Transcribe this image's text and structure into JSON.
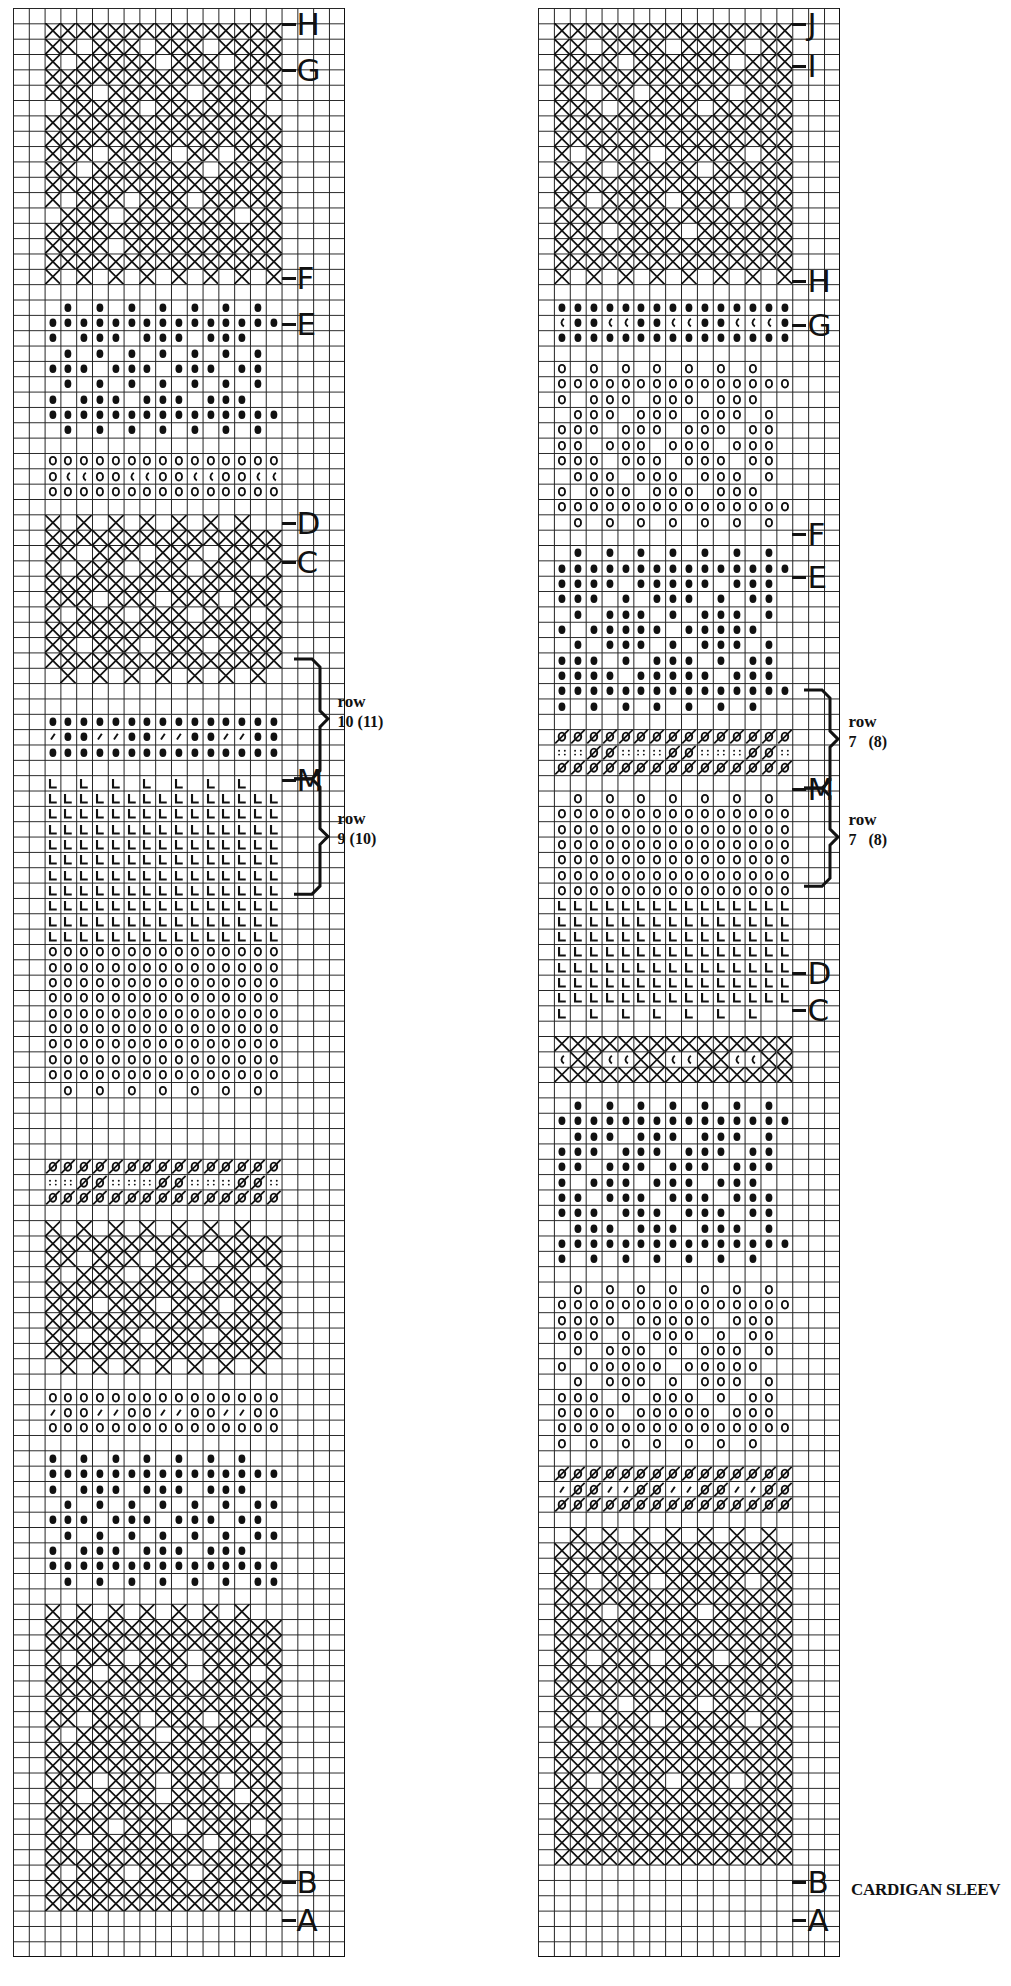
{
  "caption": "CARDIGAN SLEEV",
  "symbols": {
    "X": "cross",
    "D": "dot-filled",
    "O": "circle-open",
    "L": "corner-L",
    "S": "slash",
    "Z": "slashed-circle",
    "C": "c-mark",
    "P": "four-dots"
  },
  "charts": [
    {
      "id": "left",
      "x": 13,
      "y": 8,
      "cols": 21,
      "rows": 127,
      "cell_w": 15.8,
      "cell_h": 15.35,
      "pattern_col_start": 2,
      "pattern_cols": 15,
      "markers": [
        {
          "label": "H",
          "row": 1
        },
        {
          "label": "G",
          "row": 4
        },
        {
          "label": "F",
          "row": 17.5
        },
        {
          "label": "E",
          "row": 20.5
        },
        {
          "label": "D",
          "row": 33.5
        },
        {
          "label": "C",
          "row": 36
        },
        {
          "label": "M",
          "row": 50.2
        },
        {
          "label": "B",
          "row": 122
        },
        {
          "label": "A",
          "row": 124.5
        }
      ],
      "braces": [
        {
          "row_top": 42.4,
          "row_bottom": 50.2,
          "label_word": "row",
          "label_num": "10 (11)"
        },
        {
          "row_top": 50.2,
          "row_bottom": 57.7,
          "label_word": "row",
          "label_num": "9 (10)"
        }
      ],
      "sections": [
        {
          "start": 1,
          "rows": [
            "XXXXXXXXXXXXXXX",
            "XX.XXX.XXX.XXXX",
            "X.XXXXX.XXX.XXX",
            "XXXXXXXXXXXXXXX",
            "XXX.XXXXX.XXX.X",
            ".XXXXX.XXXXXXX.",
            "XXXXXXXXXXXXXXX",
            "XXXXXXXXXXXXXXX",
            "XXX.XXXX.XX.XXX",
            "XX.XXXXXXX.XXXX",
            "XXXXXXXXXXXXXXX",
            "X.XXX.XXX.XXXXX",
            ".XXX.XXXXXXX.XX",
            "XXXXXXXXXXXXXXX",
            "XXXX.XXXXXXXXXX",
            "XXXXXXXXXXXXXXX",
            "X.X.X.X.X.X.X.X"
          ]
        },
        {
          "start": 19,
          "rows": [
            ".D.D.D.D.D.D.D.",
            "DDDDDDDDDDDDDDD",
            "D.DDD.DDD.DDD..",
            ".D.D.D.D.D.D.D.",
            "DDD.DDD.DDD.DD.",
            ".D.D.D.D.D.D.D.",
            "D.DDD.DDD.DDD..",
            "DDDDDDDDDDDDDDD",
            ".D.D.D.D.D.D.D."
          ]
        },
        {
          "start": 29,
          "rows": [
            "OOOOOOOOOOOOOOO",
            "OCCOOCCOOCCOOCC",
            "OOOOOOOOOOOOOOO"
          ]
        },
        {
          "start": 33,
          "rows": [
            "X.X.X.X.X.X.X..",
            "XXXXXXXXXXXXXXX",
            "XX.XXX.XXX.XXXX",
            "X.XXX.XXX.XXX.X",
            "XXXXXXXXXXXXXXX",
            "XXX.XXX.XXX.XXX",
            "X.XXX.XXX.XXX.X",
            "XXXXXXXXXXXXXXX",
            "XX.XXX.XXX.XXXX",
            "XXXXXXXXXXXXXXX",
            ".X.X.X.X.X.X.X."
          ]
        },
        {
          "start": 46,
          "rows": [
            "DDDDDDDDDDDDDDD",
            "SDDSSDDSSDDSSDD",
            "DDDDDDDDDDDDDDD"
          ]
        },
        {
          "start": 50,
          "rows": [
            "L.L.L.L.L.L.L..",
            "LLLLLLLLLLLLLLL",
            "LLLLLLLLLLLLLLL",
            "LLLLLLLLLLLLLLL",
            "LLLLLLLLLLLLLLL",
            "LLLLLLLLLLLLLLL",
            "LLLLLLLLLLLLLLL",
            "LLLLLLLLLLLLLLL",
            "LLLLLLLLLLLLLLL",
            "LLLLLLLLLLLLLLL",
            "LLLLLLLLLLLLLLL",
            "OOOOOOOOOOOOOOO",
            "OOOOOOOOOOOOOOO",
            "OOOOOOOOOOOOOOO",
            "OOOOOOOOOOOOOOO",
            "OOOOOOOOOOOOOOO",
            "OOOOOOOOOOOOOOO",
            "OOOOOOOOOOOOOOO",
            "OOOOOOOOOOOOOOO",
            "OOOOOOOOOOOOOOO",
            ".O.O.O.O.O.O.O."
          ]
        },
        {
          "start": 75,
          "rows": [
            "ZZZZZZZZZZZZZZZ",
            "PPZZPPPZZPPPZZP",
            "ZZZZZZZZZZZZZZZ"
          ]
        },
        {
          "start": 79,
          "rows": [
            "X.X.X.X.X.X.X..",
            "XXXXXXXXXXXXXXX",
            "XX.XXX.XXX.XXXX",
            "X.XXX.XXX.XXX.X",
            "XXXXXXXXXXXXXXX",
            "XXX.XXX.XXX.XXX",
            "XXXXXXXXXXXXXXX",
            "XX.XXX.XXX.XXXX",
            "XXXXXXXXXXXXXXX",
            ".X.X.X.X.X.X.X."
          ]
        },
        {
          "start": 90,
          "rows": [
            "OOOOOOOOOOOOOOO",
            "SOOSSOOSSOOSSOO",
            "OOOOOOOOOOOOOOO"
          ]
        },
        {
          "start": 94,
          "rows": [
            "D.D.D.D.D.D.D..",
            "DDDDDDDDDDDDDDD",
            "D.DDD.DDD.DDD..",
            ".D.D.D.D.D.D.DD",
            "DDD.DDD.DDD.DD.",
            ".D.D.D.D.D.D.DD",
            "D.DDD.DDD.DDD..",
            "DDDDDDDDDDDDDDD",
            ".D.D.D.D.D.D.DD"
          ]
        },
        {
          "start": 104,
          "rows": [
            "X.X.X.X.X.X.X..",
            "XXXXXXXXXXXXXXX",
            "XXXXXXXXXXXXXXX",
            "X.XXX.XXX.XXXXX",
            "XXX.XXXXX.XXX.X",
            "XXXXXXXXXXXXXXX",
            "XXXXXXXXXXXXXXX",
            "XX.XXX.XXX.XXXX",
            "X.XXXXX.XXXXX.X",
            "XXXXXXXXXXXXXXX",
            "XXXXXXXXXXXXXXX",
            "XXX.XXX.XXX.XXX",
            "XX.XXXX.XXXX.XX",
            "XXXXXXXXXXXXXXX",
            "XXXX.XXX.XXXX.X",
            "XX.XXXXXXX.XXXX",
            "XXXXXXXXXXXXXXX",
            "X.XXX.XXX.XXXXX",
            "XXXXXXXXXXXXXXX",
            "XXXXXXXXXXXXXXX"
          ]
        }
      ]
    },
    {
      "id": "right",
      "x": 538,
      "y": 8,
      "cols": 19,
      "rows": 127,
      "cell_w": 15.9,
      "cell_h": 15.35,
      "pattern_col_start": 1,
      "pattern_cols": 15,
      "markers": [
        {
          "label": "J",
          "row": 1
        },
        {
          "label": "I",
          "row": 3.7
        },
        {
          "label": "H",
          "row": 17.7
        },
        {
          "label": "G",
          "row": 20.6
        },
        {
          "label": "F",
          "row": 34.2
        },
        {
          "label": "E",
          "row": 37
        },
        {
          "label": "M",
          "row": 50.8
        },
        {
          "label": "D",
          "row": 62.8
        },
        {
          "label": "C",
          "row": 65.2
        },
        {
          "label": "B",
          "row": 122
        },
        {
          "label": "A",
          "row": 124.5
        }
      ],
      "braces": [
        {
          "row_top": 44.4,
          "row_bottom": 50.8,
          "label_word": "row",
          "label_num": "7   (8)"
        },
        {
          "row_top": 50.8,
          "row_bottom": 57.2,
          "label_word": "row",
          "label_num": "7   (8)"
        }
      ],
      "sections": [
        {
          "start": 1,
          "rows": [
            "XXXXXXXXXXXXXXX",
            "XX.XXXX.XXXX.XX",
            "XXXX.XXXXXX.XXX",
            "XXXXXXXXXXXXXXX",
            "XX.XX.XXXXX.XXX",
            "XXX.XXXXX.XXXXX",
            "XXXXXXXXXXXXXXX",
            "XXXXXXXXXXXXXXX",
            "X.XXXX.XXXXX.XX",
            "XXX.XXXXX.XXXXX",
            "XXXXXXXXXXXXXXX",
            "XX.XXXX.XXX.XXX",
            "XXXXXXXXXXXXXXX",
            "XXX.XXXX.XXXXXX",
            "XXXXXXXXXXXXXXX",
            "XXXXXXXXXXXXXXX",
            "X.X.X.X.X.X.X.X"
          ]
        },
        {
          "start": 19,
          "rows": [
            "DDDDDDDDDDDDDDD",
            "CDDCCDDCCDDCCCD",
            "DDDDDDDDDDDDDDD"
          ]
        },
        {
          "start": 23,
          "rows": [
            "O.O.O.O.O.O.O..",
            "OOOOOOOOOOOOOOO",
            "O.OOO.OOO.OOO..",
            ".OOO.OOO.OOO.O.",
            "OOO.OOO.OOO.OO.",
            "OO.OOO.OOO.OOO.",
            "OOO.OOO.OOO.OO.",
            ".OOO.OOO.OOO.O.",
            "O.OOO.OOO.OOO..",
            "OOOOOOOOOOOOOOO",
            ".O.O.O.O.O.O.O."
          ]
        },
        {
          "start": 35,
          "rows": [
            ".D.D.D.D.D.D.D.",
            "DDDDDDDDDDDDDDD",
            "DDDD.DDDDD.DDD.",
            "DDD.D.DDD.D.DD.",
            ".D.DDD.D.DDD.D.",
            "D.DDDDD.DDDDD..",
            ".D.DDD.D.DDD.D.",
            "DDD.D.DDD.D.DD.",
            "DDDD.DDDDD.DDD.",
            "DDDDDDDDDDDDDDD",
            "D.D.D.D.D.D.D.."
          ]
        },
        {
          "start": 47,
          "rows": [
            "ZZZZZZZZZZZZZZZ",
            "PPZZPPPZZPPPZZP",
            "ZZZZZZZZZZZZZZZ"
          ]
        },
        {
          "start": 51,
          "rows": [
            ".O.O.O.O.O.O.O.",
            "OOOOOOOOOOOOOOO",
            "OOOOOOOOOOOOOOO",
            "OOOOOOOOOOOOOOO",
            "OOOOOOOOOOOOOOO",
            "OOOOOOOOOOOOOOO",
            "OOOOOOOOOOOOOOO",
            "LLLLLLLLLLLLLLL",
            "LLLLLLLLLLLLLLL",
            "LLLLLLLLLLLLLLL",
            "LLLLLLLLLLLLLLL",
            "LLLLLLLLLLLLLLL",
            "LLLLLLLLLLLLLLL",
            "LLLLLLLLLLLLLLL",
            "L.L.L.L.L.L.L.."
          ]
        },
        {
          "start": 67,
          "rows": [
            "XXXXXXXXXXXXXXX",
            "CXXCCXXCCXXCCXX",
            "XXXXXXXXXXXXXXX"
          ]
        },
        {
          "start": 71,
          "rows": [
            ".D.D.D.D.D.D.D.",
            "DDDDDDDDDDDDDDD",
            ".DDD.DDD.DDD.D.",
            "DDD.DDD.DDD.DD.",
            "DD.DDD.DDD.DDD.",
            "D.DDD.DDD.DDD..",
            "DD.DDD.DDD.DDD.",
            "DDD.DDD.DDD.DD.",
            ".DDD.DDD.DDD.D.",
            "DDDDDDDDDDDDDDD",
            "D.D.D.D.D.D.D.."
          ]
        },
        {
          "start": 83,
          "rows": [
            ".O.O.O.O.O.O.O.",
            "OOOOOOOOOOOOOOO",
            "OOOO.OOOOO.OOO.",
            "OOO.O.OOO.O.OO.",
            ".O.OOO.O.OOO.O.",
            "O.OOOOO.OOOOO..",
            ".O.OOO.O.OOO.O.",
            "OOO.O.OOO.O.OO.",
            "OOOO.OOOOO.OOO.",
            "OOOOOOOOOOOOOOO",
            "O.O.O.O.O.O.O.."
          ]
        },
        {
          "start": 95,
          "rows": [
            "ZZZZZZZZZZZZZZZ",
            "SZZSSZZSSZZSSZZ",
            "ZZZZZZZZZZZZZZZ"
          ]
        },
        {
          "start": 99,
          "rows": [
            ".X.X.X.X.X.X.X.",
            "XXXXXXXXXXXXXXX",
            "XXXXXXXXXXXXXXX",
            "XX.XXX.XXXXX.XX",
            "XXXXXXXXXXXXXXX",
            "XXX.XXXXX.XXXXX",
            "XXXXXXXXXXXXXXX",
            "XXXXXXXXXXXXXXX",
            "XX.XXX.XXX.XXXX",
            "XXXXXXXXXXXXXXX",
            "XXXXXXXXXXXXXXX",
            "XXXX.XXXX.XXXXX",
            "XX.XXX.XXXXX.XX",
            "XXXXXXXXXXXXXXX",
            "XXXXXXXXXXXXXXX",
            "XXXXXXXXXXXXXXX",
            "XX.XXXX.XXX.XXX",
            "XXXXXXXXXXXXXXX",
            "XXXXXXXXXXXXXXX",
            "XXXXXXXXXXXXXXX",
            "XXXXXXXXXXXXXXX",
            "XXXXXXXXXXXXXXX"
          ]
        }
      ]
    }
  ]
}
